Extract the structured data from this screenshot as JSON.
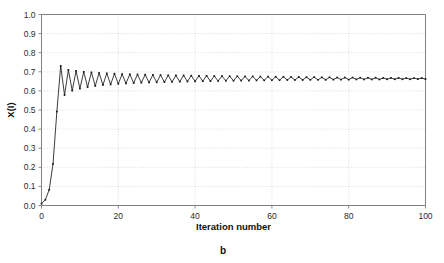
{
  "figure": {
    "caption": "b",
    "background_color": "#ffffff"
  },
  "chart_data": {
    "type": "line",
    "title": "",
    "subtitle": "",
    "xlabel": "Iteration number",
    "ylabel": "X(I)",
    "xlim": [
      0,
      100
    ],
    "ylim": [
      0.0,
      1.0
    ],
    "grid": true,
    "grid_color": "#c8c8c8",
    "axis_color": "#808080",
    "series_color": "#1a1a1a",
    "legend": null,
    "legend_position": "none",
    "marker": "square",
    "xticks": [
      0,
      20,
      40,
      60,
      80,
      100
    ],
    "xtick_labels": [
      "0",
      "20",
      "40",
      "60",
      "80",
      "100"
    ],
    "yticks": [
      0.0,
      0.1,
      0.2,
      0.3,
      0.4,
      0.5,
      0.6,
      0.7,
      0.8,
      0.9,
      1.0
    ],
    "ytick_labels": [
      "0.0",
      "0.1",
      "0.2",
      "0.3",
      "0.4",
      "0.5",
      "0.6",
      "0.7",
      "0.8",
      "0.9",
      "1.0"
    ],
    "annotations": [],
    "converged_value": 0.662,
    "first_peak": 0.731,
    "first_trough": 0.578,
    "x": [
      0,
      1,
      2,
      3,
      4,
      5,
      6,
      7,
      8,
      9,
      10,
      11,
      12,
      13,
      14,
      15,
      16,
      17,
      18,
      19,
      20,
      21,
      22,
      23,
      24,
      25,
      26,
      27,
      28,
      29,
      30,
      31,
      32,
      33,
      34,
      35,
      36,
      37,
      38,
      39,
      40,
      41,
      42,
      43,
      44,
      45,
      46,
      47,
      48,
      49,
      50,
      51,
      52,
      53,
      54,
      55,
      56,
      57,
      58,
      59,
      60,
      61,
      62,
      63,
      64,
      65,
      66,
      67,
      68,
      69,
      70,
      71,
      72,
      73,
      74,
      75,
      76,
      77,
      78,
      79,
      80,
      81,
      82,
      83,
      84,
      85,
      86,
      87,
      88,
      89,
      90,
      91,
      92,
      93,
      94,
      95,
      96,
      97,
      98,
      99,
      100
    ],
    "values": [
      0.01,
      0.03,
      0.082,
      0.218,
      0.492,
      0.731,
      0.578,
      0.71,
      0.601,
      0.705,
      0.612,
      0.7,
      0.62,
      0.697,
      0.626,
      0.694,
      0.631,
      0.692,
      0.634,
      0.69,
      0.637,
      0.688,
      0.639,
      0.687,
      0.641,
      0.686,
      0.643,
      0.685,
      0.644,
      0.684,
      0.645,
      0.683,
      0.646,
      0.682,
      0.647,
      0.681,
      0.648,
      0.681,
      0.649,
      0.68,
      0.65,
      0.679,
      0.651,
      0.679,
      0.651,
      0.678,
      0.652,
      0.678,
      0.653,
      0.677,
      0.653,
      0.677,
      0.654,
      0.676,
      0.654,
      0.676,
      0.655,
      0.675,
      0.655,
      0.675,
      0.656,
      0.674,
      0.656,
      0.674,
      0.657,
      0.673,
      0.657,
      0.673,
      0.657,
      0.672,
      0.658,
      0.672,
      0.658,
      0.671,
      0.658,
      0.671,
      0.659,
      0.67,
      0.659,
      0.67,
      0.659,
      0.67,
      0.66,
      0.669,
      0.66,
      0.669,
      0.66,
      0.669,
      0.66,
      0.668,
      0.661,
      0.668,
      0.661,
      0.668,
      0.661,
      0.667,
      0.661,
      0.667,
      0.662,
      0.667,
      0.662
    ]
  }
}
